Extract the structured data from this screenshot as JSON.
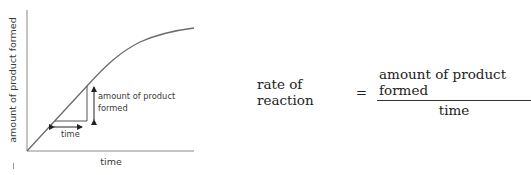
{
  "graph": {
    "y_axis_label": "amount of product formed",
    "x_axis_label": "time",
    "annotation_vertical": [
      "amount of product",
      "formed"
    ],
    "annotation_horizontal": "time",
    "line_color": "#6b6b6b",
    "axis_color": "#8a8a8a"
  },
  "equation": {
    "lhs": "rate of reaction",
    "operator": "=",
    "numerator": "amount of product formed",
    "denominator": "time"
  }
}
